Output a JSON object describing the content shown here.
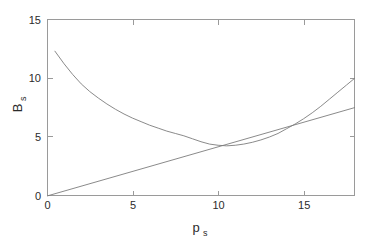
{
  "chart_data": {
    "type": "line",
    "title": "",
    "xlabel": "p_s",
    "ylabel": "B_s",
    "xlabel_base": "p",
    "xlabel_sub": "s",
    "ylabel_base": "B",
    "ylabel_sub": "s",
    "xlim": [
      0,
      18
    ],
    "ylim": [
      0,
      15
    ],
    "xticks": [
      0,
      5,
      10,
      15
    ],
    "xticklabels": [
      "0",
      "5",
      "10",
      "15"
    ],
    "yticks": [
      0,
      5,
      10,
      15
    ],
    "yticklabels": [
      "0",
      "5",
      "10",
      "15"
    ],
    "grid": false,
    "legend": null,
    "box": true,
    "tick_direction": "in",
    "line_color": "#7d7d7d",
    "axis_color": "#9a9a9a",
    "text_color": "#2b2b2b",
    "background_color": "#ffffff",
    "series": [
      {
        "name": "total-cost-curve",
        "style": "solid",
        "color": "#7d7d7d",
        "x": [
          0.45,
          1,
          1.5,
          2,
          2.5,
          3,
          3.5,
          4,
          4.5,
          5,
          5.5,
          6,
          6.5,
          7,
          7.5,
          8,
          8.5,
          9,
          9.5,
          10,
          10.5,
          11,
          11.5,
          12,
          12.5,
          13,
          13.5,
          14,
          14.5,
          15,
          15.5,
          16,
          16.5,
          17,
          17.5,
          18
        ],
        "y": [
          12.3,
          11.2,
          10.3,
          9.5,
          8.85,
          8.3,
          7.8,
          7.35,
          6.95,
          6.6,
          6.3,
          6.0,
          5.75,
          5.5,
          5.3,
          5.1,
          4.85,
          4.6,
          4.4,
          4.3,
          4.25,
          4.3,
          4.4,
          4.55,
          4.75,
          5.0,
          5.3,
          5.7,
          6.1,
          6.55,
          7.05,
          7.6,
          8.2,
          8.8,
          9.4,
          10.0
        ]
      },
      {
        "name": "variable-cost-line",
        "style": "solid",
        "color": "#7d7d7d",
        "x": [
          0,
          18
        ],
        "y": [
          0,
          7.5
        ]
      }
    ],
    "annotations": []
  },
  "figure": {
    "plot_area": {
      "left": 47,
      "top": 19,
      "right": 355,
      "bottom": 196
    }
  }
}
